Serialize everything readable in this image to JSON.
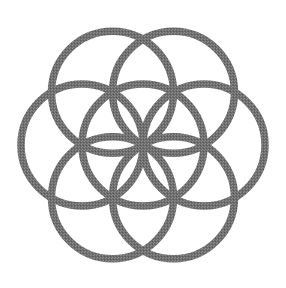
{
  "canvas": {
    "width": 286,
    "height": 288,
    "background_color": "#ffffff"
  },
  "artwork": {
    "name": "Seed of Life",
    "type": "sacred-geometry-line-figure",
    "alt_text": "Seed of Life symbol: seven overlapping equal circles forming a six-petal rosette",
    "stroke_color": "#6e6e6e",
    "stroke_width": 7.5,
    "fill": "none",
    "render_style": "halftone-dithered-grayscale",
    "symmetry": "6-fold rotational (D6)",
    "circle_count": 7
  },
  "geometry": {
    "center_x": 143,
    "center_y": 145,
    "radius": 61,
    "ring_offset": 61,
    "ring_angles_deg": [
      0,
      60,
      120,
      180,
      240,
      300
    ],
    "bounds": {
      "left": 21,
      "top": 23,
      "right": 265,
      "bottom": 267
    },
    "circles": [
      {
        "id": "center",
        "label": "Center circle",
        "cx": 143,
        "cy": 145,
        "r": 61
      },
      {
        "id": "ring-0deg",
        "label": "Right circle",
        "cx": 204,
        "cy": 145,
        "r": 61
      },
      {
        "id": "ring-60deg",
        "label": "Lower-right circle",
        "cx": 173.5,
        "cy": 197.82,
        "r": 61
      },
      {
        "id": "ring-120deg",
        "label": "Lower-left circle",
        "cx": 112.5,
        "cy": 197.82,
        "r": 61
      },
      {
        "id": "ring-180deg",
        "label": "Left circle",
        "cx": 82,
        "cy": 145,
        "r": 61
      },
      {
        "id": "ring-240deg",
        "label": "Upper-left circle",
        "cx": 112.5,
        "cy": 92.18,
        "r": 61
      },
      {
        "id": "ring-300deg",
        "label": "Upper-right circle",
        "cx": 173.5,
        "cy": 92.18,
        "r": 61
      }
    ]
  }
}
